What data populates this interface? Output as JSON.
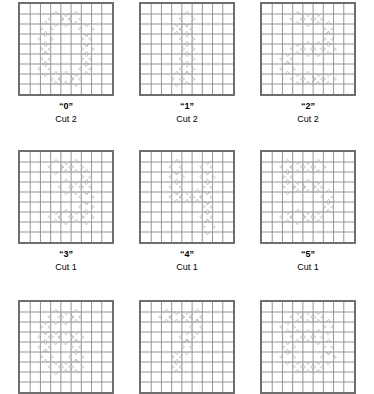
{
  "page": {
    "background_color": "#ffffff",
    "grid_border_color": "#6e6e6e",
    "grid_line_color": "#8a8a8a",
    "piece_outline_color": "#b0b0b0",
    "text_color": "#000000",
    "grid_columns": 9,
    "grid_rows": 9
  },
  "patterns": [
    {
      "name": "“0”",
      "cut": "Cut 2",
      "digit": "0",
      "row": 1,
      "column": 1,
      "cells": [
        [
          3,
          1
        ],
        [
          4,
          1
        ],
        [
          5,
          1
        ],
        [
          2,
          2
        ],
        [
          6,
          2
        ],
        [
          2,
          3
        ],
        [
          6,
          3
        ],
        [
          2,
          4
        ],
        [
          6,
          4
        ],
        [
          2,
          5
        ],
        [
          6,
          5
        ],
        [
          2,
          6
        ],
        [
          6,
          6
        ],
        [
          3,
          7
        ],
        [
          4,
          7
        ],
        [
          5,
          7
        ]
      ]
    },
    {
      "name": "“1”",
      "cut": "Cut 2",
      "digit": "1",
      "row": 1,
      "column": 2,
      "cells": [
        [
          4,
          1
        ],
        [
          3,
          2
        ],
        [
          4,
          2
        ],
        [
          4,
          3
        ],
        [
          4,
          4
        ],
        [
          4,
          5
        ],
        [
          4,
          6
        ],
        [
          3,
          7
        ],
        [
          4,
          7
        ]
      ]
    },
    {
      "name": "“2”",
      "cut": "Cut 2",
      "digit": "2",
      "row": 1,
      "column": 3,
      "cells": [
        [
          3,
          1
        ],
        [
          4,
          1
        ],
        [
          5,
          1
        ],
        [
          6,
          2
        ],
        [
          6,
          3
        ],
        [
          3,
          4
        ],
        [
          4,
          4
        ],
        [
          5,
          4
        ],
        [
          6,
          4
        ],
        [
          2,
          5
        ],
        [
          2,
          6
        ],
        [
          3,
          7
        ],
        [
          4,
          7
        ],
        [
          5,
          7
        ],
        [
          6,
          7
        ]
      ]
    },
    {
      "name": "“3”",
      "cut": "Cut 1",
      "digit": "3",
      "row": 2,
      "column": 1,
      "cells": [
        [
          3,
          1
        ],
        [
          4,
          1
        ],
        [
          5,
          1
        ],
        [
          6,
          2
        ],
        [
          4,
          3
        ],
        [
          5,
          3
        ],
        [
          6,
          3
        ],
        [
          6,
          4
        ],
        [
          6,
          5
        ],
        [
          3,
          6
        ],
        [
          4,
          6
        ],
        [
          5,
          6
        ],
        [
          6,
          6
        ]
      ]
    },
    {
      "name": "“4”",
      "cut": "Cut 1",
      "digit": "4",
      "row": 2,
      "column": 2,
      "cells": [
        [
          3,
          1
        ],
        [
          6,
          1
        ],
        [
          3,
          2
        ],
        [
          6,
          2
        ],
        [
          3,
          3
        ],
        [
          6,
          3
        ],
        [
          3,
          4
        ],
        [
          4,
          4
        ],
        [
          5,
          4
        ],
        [
          6,
          4
        ],
        [
          6,
          5
        ],
        [
          6,
          6
        ],
        [
          6,
          7
        ]
      ]
    },
    {
      "name": "“5”",
      "cut": "Cut 1",
      "digit": "5",
      "row": 2,
      "column": 3,
      "cells": [
        [
          2,
          1
        ],
        [
          3,
          1
        ],
        [
          4,
          1
        ],
        [
          5,
          1
        ],
        [
          2,
          2
        ],
        [
          2,
          3
        ],
        [
          3,
          3
        ],
        [
          4,
          3
        ],
        [
          5,
          3
        ],
        [
          6,
          4
        ],
        [
          6,
          5
        ],
        [
          2,
          6
        ],
        [
          3,
          6
        ],
        [
          4,
          6
        ],
        [
          5,
          6
        ]
      ]
    },
    {
      "name": "",
      "cut": "",
      "digit": "6",
      "row": 3,
      "column": 1,
      "cells": [
        [
          3,
          1
        ],
        [
          4,
          1
        ],
        [
          5,
          1
        ],
        [
          2,
          2
        ],
        [
          2,
          3
        ],
        [
          3,
          3
        ],
        [
          4,
          3
        ],
        [
          5,
          3
        ],
        [
          2,
          4
        ],
        [
          5,
          4
        ],
        [
          2,
          5
        ],
        [
          5,
          5
        ],
        [
          3,
          6
        ],
        [
          4,
          6
        ],
        [
          5,
          6
        ]
      ]
    },
    {
      "name": "",
      "cut": "",
      "digit": "7",
      "row": 3,
      "column": 2,
      "cells": [
        [
          2,
          1
        ],
        [
          3,
          1
        ],
        [
          4,
          1
        ],
        [
          5,
          1
        ],
        [
          5,
          2
        ],
        [
          4,
          3
        ],
        [
          4,
          4
        ],
        [
          3,
          5
        ],
        [
          3,
          6
        ]
      ]
    },
    {
      "name": "",
      "cut": "",
      "digit": "8",
      "row": 3,
      "column": 3,
      "cells": [
        [
          3,
          1
        ],
        [
          4,
          1
        ],
        [
          5,
          1
        ],
        [
          2,
          2
        ],
        [
          6,
          2
        ],
        [
          3,
          3
        ],
        [
          4,
          3
        ],
        [
          5,
          3
        ],
        [
          2,
          4
        ],
        [
          6,
          4
        ],
        [
          2,
          5
        ],
        [
          6,
          5
        ],
        [
          3,
          6
        ],
        [
          4,
          6
        ],
        [
          5,
          6
        ]
      ]
    }
  ]
}
